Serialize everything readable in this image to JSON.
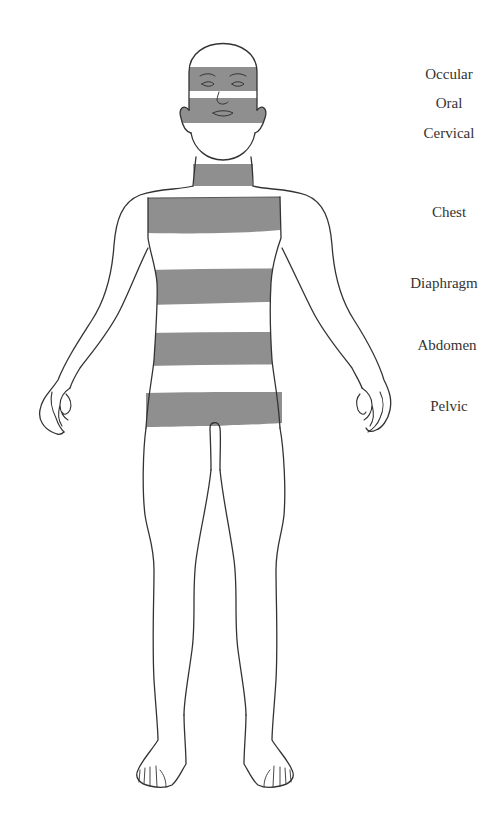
{
  "diagram": {
    "title": "",
    "band_color": "#8f8f8f",
    "outline_color": "#333333",
    "regions": [
      {
        "id": "occular",
        "label": "Occular",
        "label_x": 449,
        "label_y": 66
      },
      {
        "id": "oral",
        "label": "Oral",
        "label_x": 449,
        "label_y": 95
      },
      {
        "id": "cervical",
        "label": "Cervical",
        "label_x": 449,
        "label_y": 125
      },
      {
        "id": "chest",
        "label": "Chest",
        "label_x": 449,
        "label_y": 204
      },
      {
        "id": "diaphragm",
        "label": "Diaphragm",
        "label_x": 444,
        "label_y": 275
      },
      {
        "id": "abdomen",
        "label": "Abdomen",
        "label_x": 447,
        "label_y": 337
      },
      {
        "id": "pelvic",
        "label": "Pelvic",
        "label_x": 449,
        "label_y": 398
      }
    ]
  }
}
